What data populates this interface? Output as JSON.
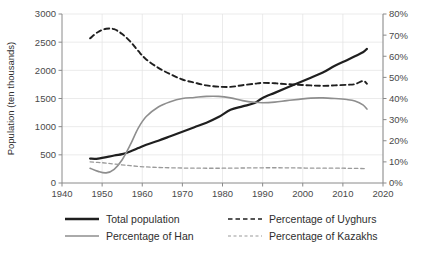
{
  "chart_data": {
    "type": "line",
    "title": "",
    "xlabel": "",
    "ylabel": "Population (ten thousands)",
    "y2label": "",
    "xlim": [
      1940,
      2020
    ],
    "ylim": [
      0,
      3000
    ],
    "y2lim": [
      0,
      80
    ],
    "grid": true,
    "legend_position": "bottom",
    "x_ticks": [
      "1940",
      "1950",
      "1960",
      "1970",
      "1980",
      "1990",
      "2000",
      "2010",
      "2020"
    ],
    "x_tick_values": [
      1940,
      1950,
      1960,
      1970,
      1980,
      1990,
      2000,
      2010,
      2020
    ],
    "y_ticks": [
      "0",
      "500",
      "1000",
      "1500",
      "2000",
      "2500",
      "3000"
    ],
    "y_tick_values": [
      0,
      500,
      1000,
      1500,
      2000,
      2500,
      3000
    ],
    "y2_ticks": [
      "0%",
      "10%",
      "20%",
      "30%",
      "40%",
      "50%",
      "60%",
      "70%",
      "80%"
    ],
    "y2_tick_values": [
      0,
      10,
      20,
      30,
      40,
      50,
      60,
      70,
      80
    ],
    "series": [
      {
        "name": "Total population",
        "axis": "left",
        "color": "#1f1f1f",
        "width": 2.2,
        "dash": "none",
        "x": [
          1947,
          1949,
          1953,
          1955,
          1957,
          1959,
          1961,
          1964,
          1967,
          1970,
          1973,
          1976,
          1979,
          1982,
          1985,
          1988,
          1990,
          1993,
          1996,
          1999,
          2002,
          2005,
          2008,
          2011,
          2013,
          2015,
          2016
        ],
        "values": [
          433,
          433,
          488,
          512,
          560,
          620,
          680,
          750,
          830,
          910,
          990,
          1070,
          1170,
          1300,
          1360,
          1420,
          1510,
          1600,
          1690,
          1780,
          1870,
          1960,
          2080,
          2180,
          2250,
          2320,
          2380
        ]
      },
      {
        "name": "Percentage of Han",
        "axis": "right",
        "color": "#8e8e8e",
        "width": 1.6,
        "dash": "none",
        "x": [
          1947,
          1949,
          1951,
          1953,
          1955,
          1957,
          1959,
          1961,
          1964,
          1967,
          1970,
          1973,
          1976,
          1979,
          1982,
          1985,
          1988,
          1990,
          1993,
          1996,
          1999,
          2002,
          2005,
          2008,
          2011,
          2013,
          2015,
          2016
        ],
        "values": [
          7.0,
          5.5,
          4.8,
          6.5,
          11.0,
          18.0,
          26.0,
          31.5,
          36.0,
          38.5,
          40.0,
          40.5,
          41.0,
          41.0,
          40.3,
          39.0,
          38.2,
          38.0,
          38.3,
          39.0,
          39.6,
          40.2,
          40.3,
          40.0,
          39.5,
          38.8,
          37.0,
          35.0
        ]
      },
      {
        "name": "Percentage of Uyghurs",
        "axis": "right",
        "color": "#1f1f1f",
        "width": 1.9,
        "dash": "5,3.5",
        "x": [
          1947,
          1949,
          1951,
          1953,
          1955,
          1957,
          1959,
          1961,
          1964,
          1967,
          1970,
          1973,
          1976,
          1979,
          1982,
          1985,
          1988,
          1990,
          1993,
          1996,
          1999,
          2002,
          2005,
          2008,
          2011,
          2013,
          2015,
          2016
        ],
        "values": [
          68.5,
          71.5,
          73.0,
          72.8,
          70.5,
          67.0,
          62.5,
          58.5,
          54.5,
          51.5,
          49.0,
          47.5,
          46.2,
          45.6,
          45.5,
          46.3,
          47.0,
          47.4,
          47.2,
          46.8,
          46.5,
          46.2,
          46.0,
          46.2,
          46.5,
          46.8,
          48.3,
          47.0
        ]
      },
      {
        "name": "Percentage of Kazakhs",
        "axis": "right",
        "color": "#9a9a9a",
        "width": 1.3,
        "dash": "3.5,2.8",
        "x": [
          1947,
          1950,
          1953,
          1957,
          1961,
          1965,
          1970,
          1975,
          1980,
          1985,
          1990,
          1995,
          2000,
          2005,
          2010,
          2013,
          2016
        ],
        "values": [
          10.0,
          9.6,
          9.0,
          8.2,
          7.6,
          7.3,
          7.1,
          7.0,
          7.0,
          7.1,
          7.2,
          7.2,
          7.1,
          7.0,
          7.0,
          6.9,
          6.8
        ]
      }
    ],
    "legend": [
      {
        "label": "Total population",
        "color": "#1f1f1f",
        "dash": "none",
        "width": 2.6
      },
      {
        "label": "Percentage of Uyghurs",
        "color": "#1f1f1f",
        "dash": "4.5,3",
        "width": 1.7
      },
      {
        "label": "Percentage of Han",
        "color": "#8e8e8e",
        "dash": "none",
        "width": 1.4
      },
      {
        "label": "Percentage of Kazakhs",
        "color": "#9a9a9a",
        "dash": "3,2.5",
        "width": 1.2
      }
    ]
  },
  "colors": {
    "grid": "#e2e2e2",
    "axis": "#8a8a8a",
    "text": "#3d3d3d",
    "background": "#ffffff"
  }
}
